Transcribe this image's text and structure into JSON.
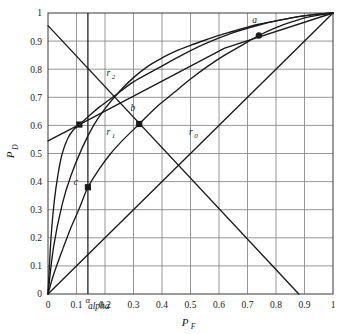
{
  "chart_data": {
    "type": "line",
    "title": "",
    "xlabel": "P_F",
    "ylabel": "P_D",
    "xlabel_main": "P",
    "xlabel_sub": "F",
    "ylabel_main": "P",
    "ylabel_sub": "D",
    "xlim": [
      0,
      1
    ],
    "ylim": [
      0,
      1
    ],
    "grid": true,
    "legend_position": "inline-annotations",
    "xticks": [
      0,
      0.1,
      0.2,
      0.3,
      0.4,
      0.5,
      0.6,
      0.7,
      0.8,
      0.9,
      1
    ],
    "xticklabels": [
      "0",
      "0.1",
      "0.2",
      "0.3",
      "0.4",
      "0.5",
      "0.6",
      "0.7",
      "0.8",
      "0.9",
      "1"
    ],
    "yticks": [
      0,
      0.1,
      0.2,
      0.3,
      0.4,
      0.5,
      0.6,
      0.7,
      0.8,
      0.9,
      1
    ],
    "yticklabels": [
      "0",
      "0.1",
      "0.2",
      "0.3",
      "0.4",
      "0.5",
      "0.6",
      "0.7",
      "0.8",
      "0.9",
      "1"
    ],
    "series": [
      {
        "name": "r2",
        "label": "r",
        "label_sub": "2",
        "kind": "roc-curve",
        "description": "Upper ROC curve, most concave, passes through point a",
        "points": [
          [
            0.0,
            0.0
          ],
          [
            0.02,
            0.17
          ],
          [
            0.05,
            0.32
          ],
          [
            0.08,
            0.42
          ],
          [
            0.12,
            0.52
          ],
          [
            0.16,
            0.6
          ],
          [
            0.2,
            0.66
          ],
          [
            0.25,
            0.72
          ],
          [
            0.3,
            0.77
          ],
          [
            0.35,
            0.81
          ],
          [
            0.4,
            0.84
          ],
          [
            0.45,
            0.865
          ],
          [
            0.5,
            0.885
          ],
          [
            0.55,
            0.903
          ],
          [
            0.6,
            0.92
          ],
          [
            0.65,
            0.935
          ],
          [
            0.7,
            0.95
          ],
          [
            0.74,
            0.96
          ],
          [
            0.8,
            0.972
          ],
          [
            0.85,
            0.982
          ],
          [
            0.9,
            0.99
          ],
          [
            0.95,
            0.996
          ],
          [
            1.0,
            1.0
          ]
        ],
        "label_pos": [
          0.205,
          0.775
        ]
      },
      {
        "name": "r1",
        "label": "r",
        "label_sub": "1",
        "kind": "roc-curve",
        "description": "Middle ROC curve through points c, b and a",
        "points": [
          [
            0.0,
            0.0
          ],
          [
            0.02,
            0.07
          ],
          [
            0.05,
            0.155
          ],
          [
            0.08,
            0.235
          ],
          [
            0.11,
            0.305
          ],
          [
            0.14,
            0.38
          ],
          [
            0.18,
            0.445
          ],
          [
            0.22,
            0.5
          ],
          [
            0.26,
            0.545
          ],
          [
            0.32,
            0.605
          ],
          [
            0.38,
            0.665
          ],
          [
            0.44,
            0.715
          ],
          [
            0.5,
            0.765
          ],
          [
            0.56,
            0.81
          ],
          [
            0.62,
            0.85
          ],
          [
            0.68,
            0.885
          ],
          [
            0.74,
            0.92
          ],
          [
            0.8,
            0.948
          ],
          [
            0.86,
            0.97
          ],
          [
            0.92,
            0.987
          ],
          [
            1.0,
            1.0
          ]
        ],
        "label_pos": [
          0.205,
          0.565
        ]
      },
      {
        "name": "r0",
        "label": "r",
        "label_sub": "0",
        "kind": "chance-diagonal",
        "description": "Chance line, the diagonal y = x",
        "points": [
          [
            0.0,
            0.0
          ],
          [
            1.0,
            1.0
          ]
        ],
        "label_pos": [
          0.495,
          0.565
        ]
      },
      {
        "name": "steep-roc",
        "label": "",
        "label_sub": "",
        "kind": "roc-curve",
        "description": "Steep leftmost ROC curve rising sharply from origin",
        "points": [
          [
            0.0,
            0.0
          ],
          [
            0.005,
            0.1
          ],
          [
            0.012,
            0.22
          ],
          [
            0.022,
            0.33
          ],
          [
            0.035,
            0.425
          ],
          [
            0.05,
            0.5
          ],
          [
            0.07,
            0.555
          ],
          [
            0.09,
            0.585
          ],
          [
            0.11,
            0.603
          ],
          [
            0.14,
            0.63
          ],
          [
            0.18,
            0.665
          ],
          [
            0.24,
            0.71
          ],
          [
            0.3,
            0.755
          ],
          [
            0.38,
            0.8
          ],
          [
            0.46,
            0.845
          ],
          [
            0.55,
            0.89
          ],
          [
            0.65,
            0.93
          ],
          [
            0.75,
            0.96
          ],
          [
            0.85,
            0.982
          ],
          [
            0.93,
            0.994
          ],
          [
            1.0,
            1.0
          ]
        ],
        "label_pos": null
      },
      {
        "name": "shallow-line",
        "label": "",
        "label_sub": "",
        "kind": "line",
        "description": "Shallow ascending line from left edge through (0.11, 0.60) to upper right",
        "points": [
          [
            0.0,
            0.545
          ],
          [
            0.11,
            0.603
          ],
          [
            0.32,
            0.715
          ],
          [
            0.62,
            0.875
          ],
          [
            1.0,
            1.0
          ]
        ],
        "label_pos": null
      },
      {
        "name": "descending-line",
        "label": "",
        "label_sub": "",
        "kind": "line",
        "description": "Descending straight line from (0, 0.955) to (0.88, 0)",
        "points": [
          [
            0.0,
            0.955
          ],
          [
            0.88,
            0.0
          ]
        ],
        "label_pos": null
      },
      {
        "name": "alpha-line",
        "label": "alpha",
        "label_sub": "",
        "kind": "vertical-threshold",
        "description": "Vertical threshold line at P_F = alpha",
        "x": 0.14,
        "label_pos": [
          0.14,
          -0.055
        ]
      }
    ],
    "annotations": [
      {
        "name": "point-a",
        "label": "a",
        "x": 0.74,
        "y": 0.92,
        "label_offset": [
          -0.015,
          0.045
        ],
        "marker": "filled-circle"
      },
      {
        "name": "point-b",
        "label": "b",
        "x": 0.32,
        "y": 0.605,
        "label_offset": [
          -0.022,
          0.048
        ],
        "marker": "filled-square"
      },
      {
        "name": "point-c",
        "label": "c",
        "x": 0.14,
        "y": 0.38,
        "label_offset": [
          -0.042,
          0.008
        ],
        "marker": "filled-square"
      },
      {
        "name": "point-intersection-left",
        "label": "",
        "x": 0.11,
        "y": 0.603,
        "label_offset": [
          0,
          0
        ],
        "marker": "filled-square"
      }
    ],
    "alpha_symbol": "α",
    "colors": {
      "curve": "#1a1a1a",
      "grid": "#8a8a8a",
      "frame": "#4a4a4a",
      "text": "#1a1a1a",
      "background": "#ffffff"
    }
  }
}
